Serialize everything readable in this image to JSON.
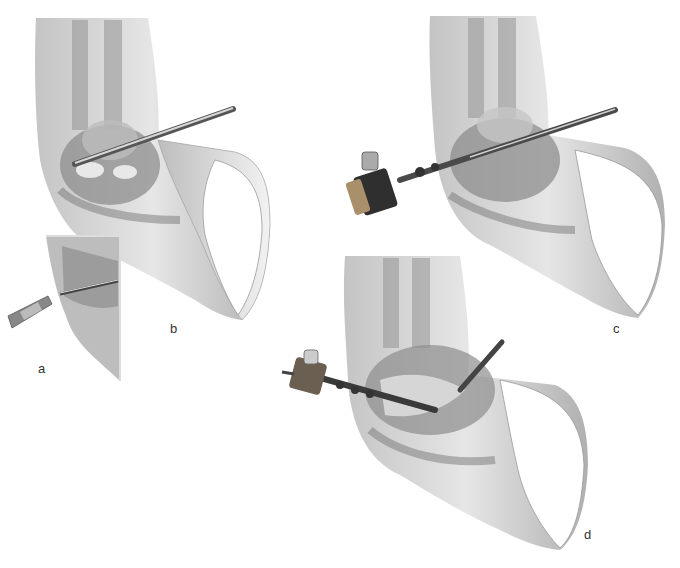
{
  "figure": {
    "type": "surgical illustration",
    "panels": [
      {
        "id": "a",
        "label": "a",
        "description": "inset: trocar/needle entering skin portal"
      },
      {
        "id": "b",
        "label": "b",
        "description": "cannula with blunt obturator inserted across joint"
      },
      {
        "id": "c",
        "label": "c",
        "description": "arthroscope inserted through cannula"
      },
      {
        "id": "d",
        "label": "d",
        "description": "arthroscope with instrument, joint capsule opened"
      }
    ],
    "colors": {
      "background": "#ffffff",
      "skin": "#d8d8d8",
      "skin_shadow": "#a8a8a8",
      "tissue": "#8a8a8a",
      "instrument": "#4a4a4a",
      "instrument_highlight": "#cfcfcf",
      "label_text": "#333333"
    }
  }
}
